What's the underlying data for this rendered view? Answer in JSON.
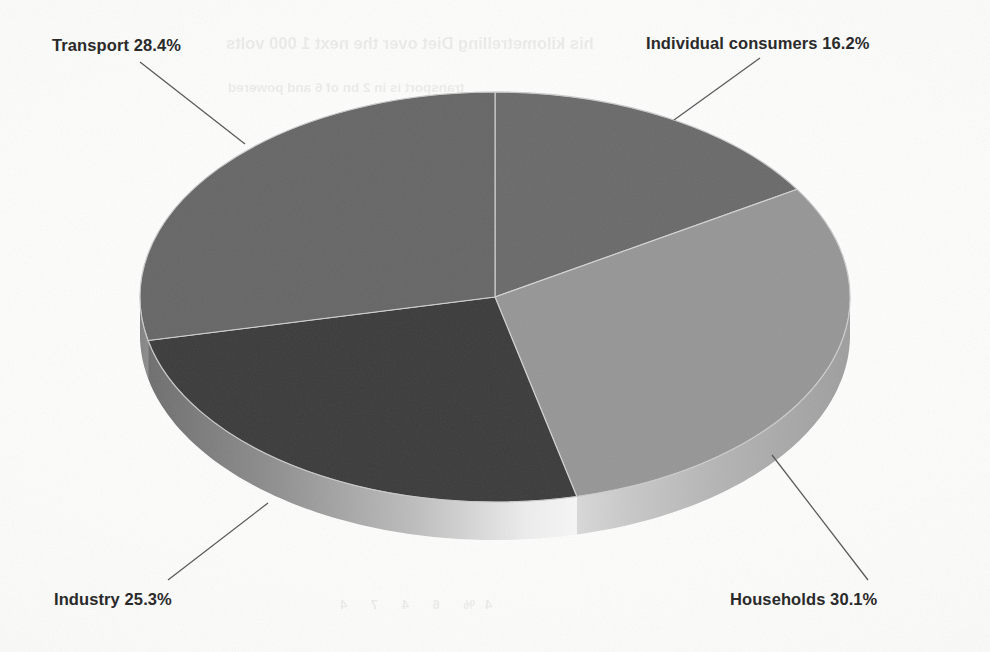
{
  "chart_data": {
    "type": "pie",
    "title": "",
    "subtitle": "",
    "xlabel": "",
    "ylabel": "",
    "grid": false,
    "legend_position": "none",
    "label_style": "callout labels with leader lines outside the pie",
    "render_style": "3d-pie-grayscale-scanned",
    "start_angle_deg": 0,
    "direction": "clockwise",
    "units": "percent",
    "total": 100.0,
    "categories": [
      "Individual consumers",
      "Households",
      "Industry",
      "Transport"
    ],
    "values": [
      16.2,
      30.1,
      25.3,
      28.4
    ],
    "slices": [
      {
        "label": "Individual consumers",
        "value": 16.2,
        "display": "Individual consumers 16.2%",
        "color": "#6a6a6a",
        "side_color": "#9a9a9a"
      },
      {
        "label": "Households",
        "value": 30.1,
        "display": "Households 30.1%",
        "color": "#969696",
        "side_color": "#c8c8c8"
      },
      {
        "label": "Industry",
        "value": 25.3,
        "display": "Industry 25.3%",
        "color": "#3b3b3b",
        "side_color": "#8e8e8e"
      },
      {
        "label": "Transport",
        "value": 28.4,
        "display": "Transport 28.4%",
        "color": "#666666",
        "side_color": "#8a8a8a"
      }
    ]
  },
  "labels": {
    "transport": "Transport 28.4%",
    "individual_consumers": "Individual consumers 16.2%",
    "industry": "Industry 25.3%",
    "households": "Households 30.1%"
  },
  "bleed_through": {
    "line1": "his kilometrelling Diet over the next 1 000 volts",
    "line2": "transport is in 2 bn of 6 and powered",
    "line3": "4%      6      4      7      4"
  },
  "colors": {
    "background": "#fdfdfd",
    "label_text": "#2a2a2a",
    "leader_line": "#555555",
    "slice_individual": "#6a6a6a",
    "slice_households": "#969696",
    "slice_industry": "#3b3b3b",
    "slice_transport": "#666666"
  }
}
